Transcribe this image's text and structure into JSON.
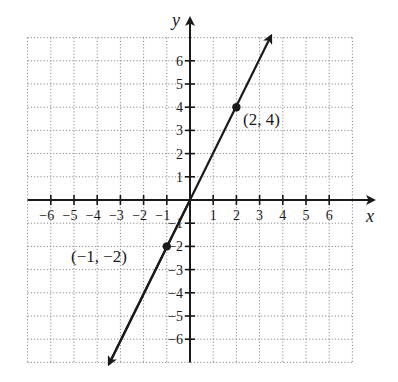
{
  "chart_data": {
    "type": "line",
    "title": "",
    "xlabel": "x",
    "ylabel": "y",
    "xlim": [
      -7,
      7
    ],
    "ylim": [
      -7,
      7
    ],
    "grid": true,
    "grid_style": "dotted",
    "x_ticks": [
      -6,
      -5,
      -4,
      -3,
      -2,
      -1,
      1,
      2,
      3,
      4,
      5,
      6
    ],
    "y_ticks": [
      -6,
      -5,
      -4,
      -3,
      -2,
      -1,
      1,
      2,
      3,
      4,
      5,
      6
    ],
    "x_tick_labels": [
      "−6",
      "−5",
      "−4",
      "−3",
      "−2",
      "−1",
      "1",
      "2",
      "3",
      "4",
      "5",
      "6"
    ],
    "y_tick_labels": [
      "−6",
      "−5",
      "−4",
      "−3",
      "−2",
      "−1",
      "1",
      "2",
      "3",
      "4",
      "5",
      "6"
    ],
    "series": [
      {
        "name": "y = 2x",
        "x": [
          -3.5,
          3.5
        ],
        "y": [
          -7,
          7
        ],
        "arrows": "both"
      }
    ],
    "points": [
      {
        "x": -1,
        "y": -2,
        "label": "(−1, −2)"
      },
      {
        "x": 2,
        "y": 4,
        "label": "(2, 4)"
      }
    ]
  },
  "labels": {
    "x_axis": "x",
    "y_axis": "y",
    "point_a": "(−1, −2)",
    "point_b": "(2, 4)"
  },
  "colors": {
    "ink": "#1a1a1a",
    "grid": "#8a8a8a",
    "background": "#ffffff"
  }
}
